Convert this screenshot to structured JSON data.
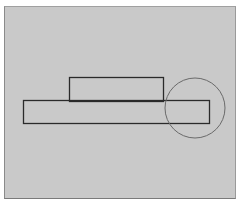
{
  "diagram": {
    "background_color": "#c9c9c9",
    "stroke_color": "#2a2a2a",
    "circle_stroke_color": "#6a6a6a",
    "shapes": [
      {
        "type": "rect",
        "name": "top-rectangle",
        "x": 69,
        "y": 77,
        "width": 94,
        "height": 24
      },
      {
        "type": "rect",
        "name": "base-rectangle",
        "x": 23,
        "y": 101,
        "width": 186,
        "height": 23
      },
      {
        "type": "circle",
        "name": "highlight-circle",
        "cx": 195,
        "cy": 108,
        "r": 30
      }
    ]
  }
}
